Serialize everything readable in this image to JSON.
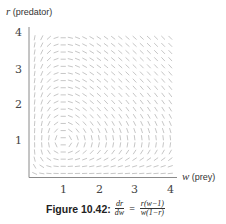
{
  "chart_data": {
    "type": "slope_field",
    "equation": "dr/dw = r(w-1)/(w(1-r))",
    "xlabel": "w (prey)",
    "ylabel": "r (predator)",
    "xlim": [
      0,
      4
    ],
    "ylim": [
      0,
      4
    ],
    "x_ticks": [
      1,
      2,
      3,
      4
    ],
    "y_ticks": [
      1,
      2,
      3,
      4
    ],
    "grid": false,
    "equilibrium_point": [
      1,
      1
    ],
    "field_grid": {
      "x_start": 0.2,
      "x_end": 4.0,
      "y_start": 0.1,
      "y_end": 4.0,
      "step": 0.2
    },
    "colors": {
      "field": "#b8b8b8",
      "axis": "#888888",
      "text": "#333333"
    }
  },
  "figure": {
    "caption_label": "Figure 10.42:",
    "eq_lhs_num": "dr",
    "eq_lhs_den": "dw",
    "eq_equals": "=",
    "eq_rhs_num": "r(w−1)",
    "eq_rhs_den": "w(1−r)"
  },
  "axes": {
    "y_title_var": "r",
    "y_title_text": "(predator)",
    "x_title_var": "w",
    "x_title_text": "(prey)",
    "x_tick_labels": [
      "1",
      "2",
      "3",
      "4"
    ],
    "y_tick_labels": [
      "1",
      "2",
      "3",
      "4"
    ]
  }
}
